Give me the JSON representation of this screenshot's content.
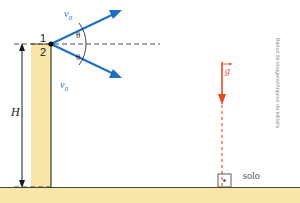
{
  "diagram": {
    "colors": {
      "vector_blue": "#1f6fc4",
      "gravity_red": "#e8491f",
      "wall_fill": "#f7e6a8",
      "wall_stroke": "#4a4a3a",
      "ground_fill": "#f7e6a8",
      "ground_stroke": "#4a4a3a",
      "dash_line": "#3a3a2e",
      "text_dark": "#1a1a1a",
      "text_gray": "#555555",
      "credit_gray": "#8a8a8a"
    },
    "labels": {
      "point_one": "1",
      "point_two": "2",
      "height": "H",
      "velocity_top": "v",
      "velocity_top_sub": "0",
      "velocity_bottom": "v",
      "velocity_bottom_sub": "0",
      "angle_top": "θ",
      "angle_bottom": "θ",
      "gravity": "g",
      "ground": "solo"
    },
    "credit": "Banco de imagens/Arquivo da editora",
    "geometry": {
      "launch_point_x": 51,
      "launch_point_y": 44,
      "wall_top_y": 44,
      "wall_bottom_y": 187,
      "wall_left_x": 31,
      "wall_right_x": 51,
      "ground_top_y": 187,
      "gravity_line_x": 222,
      "angle_degrees": 35
    }
  }
}
